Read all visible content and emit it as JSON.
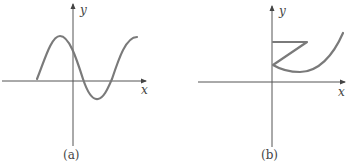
{
  "figures": [
    {
      "id": "a",
      "caption": "(a)",
      "x_axis_label": "x",
      "y_axis_label": "y",
      "description": "sinusoid-like curve: rises to a peak left of the y-axis, crosses the x-axis just right of the origin, dips to a trough, then rises again"
    },
    {
      "id": "b",
      "caption": "(b)",
      "x_axis_label": "x",
      "y_axis_label": "y",
      "description": "Z-shaped path from the y-axis: horizontal segment right, diagonal back to the y-axis, then a parabola-like curve rising to the right"
    }
  ],
  "colors": {
    "axis": "#555555",
    "curve": "#7a7a7a",
    "text": "#444444"
  }
}
